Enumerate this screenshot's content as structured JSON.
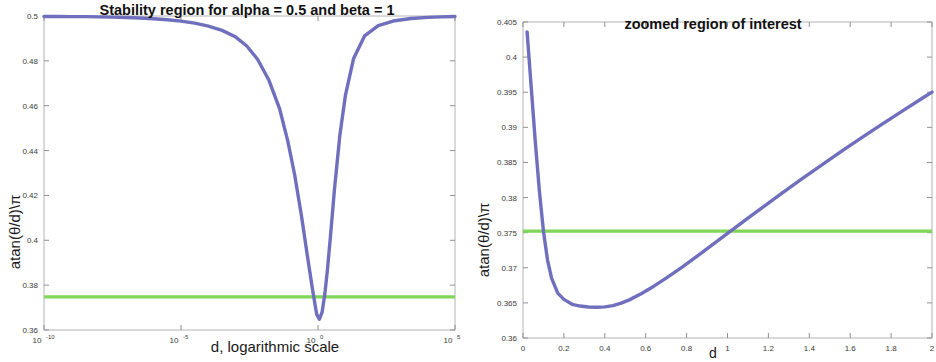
{
  "figure": {
    "width": 936,
    "height": 362,
    "background": "#ffffff",
    "panels": 2
  },
  "colors": {
    "curve_blue": "#6F6FBE",
    "threshold_green": "#7FD659",
    "axis_gray": "#b4b4b4",
    "tick_text": "#3a3a3a",
    "title_text": "#111111"
  },
  "chart_data": [
    {
      "id": "left",
      "type": "line",
      "title": "Stability region for alpha = 0.5 and beta = 1",
      "xlabel": "d, logarithmic scale",
      "ylabel": "atan(θ/d)\\π",
      "xscale": "log",
      "grid": false,
      "legend": "none",
      "xlim": [
        1e-10,
        100000.0
      ],
      "ylim": [
        0.36,
        0.5
      ],
      "xticks": [
        1e-10,
        1e-05,
        1,
        100000
      ],
      "xticklabels": [
        "10^-10",
        "10^-5",
        "10^0",
        "10^5"
      ],
      "xtick_mantissa": [
        "10",
        "10",
        "10",
        "10"
      ],
      "xtick_exponent": [
        "-10",
        "-5",
        "0",
        "5"
      ],
      "yticks": [
        0.36,
        0.38,
        0.4,
        0.42,
        0.44,
        0.46,
        0.48,
        0.5
      ],
      "yticklabels": [
        "0.36",
        "0.38",
        "0.4",
        "0.42",
        "0.44",
        "0.46",
        "0.48",
        "0.5"
      ],
      "series": [
        {
          "name": "atan(theta/d)/pi",
          "color": "#6F6FBE",
          "x_log10": [
            -10.0,
            -9.5,
            -9.0,
            -8.5,
            -8.0,
            -7.5,
            -7.0,
            -6.5,
            -6.0,
            -5.5,
            -5.0,
            -4.5,
            -4.0,
            -3.5,
            -3.0,
            -2.6,
            -2.2,
            -1.8,
            -1.4,
            -1.1,
            -0.85,
            -0.6,
            -0.4,
            -0.2,
            -0.05,
            0.05,
            0.15,
            0.25,
            0.35,
            0.45,
            0.6,
            0.8,
            1.0,
            1.3,
            1.7,
            2.2,
            2.8,
            3.4,
            4.0,
            4.5,
            5.0
          ],
          "y": [
            0.4998,
            0.4998,
            0.4997,
            0.4997,
            0.4996,
            0.4995,
            0.4993,
            0.4991,
            0.4988,
            0.4983,
            0.4977,
            0.4968,
            0.4955,
            0.4936,
            0.4906,
            0.4866,
            0.4806,
            0.4716,
            0.4586,
            0.4441,
            0.4291,
            0.4106,
            0.3941,
            0.3781,
            0.3671,
            0.3648,
            0.368,
            0.376,
            0.3876,
            0.4011,
            0.4226,
            0.4471,
            0.4646,
            0.4811,
            0.4911,
            0.4957,
            0.4979,
            0.4989,
            0.4994,
            0.4996,
            0.4998
          ]
        },
        {
          "name": "threshold",
          "color": "#7FD659",
          "constant_y": 0.3748
        }
      ],
      "annotations": {
        "minimum_value": 0.3648,
        "crossings": [
          0.3748,
          0.3748
        ]
      }
    },
    {
      "id": "right",
      "type": "line",
      "title": "zoomed region of interest",
      "xlabel": "d",
      "ylabel": "atan(θ/d)\\π",
      "xscale": "linear",
      "grid": false,
      "legend": "none",
      "xlim": [
        0,
        2
      ],
      "ylim": [
        0.36,
        0.405
      ],
      "xticks": [
        0,
        0.2,
        0.4,
        0.6,
        0.8,
        1,
        1.2,
        1.4,
        1.6,
        1.8,
        2
      ],
      "xticklabels": [
        "0",
        "0.2",
        "0.4",
        "0.6",
        "0.8",
        "1",
        "1.2",
        "1.4",
        "1.6",
        "1.8",
        "2"
      ],
      "yticks": [
        0.36,
        0.365,
        0.37,
        0.375,
        0.38,
        0.385,
        0.39,
        0.395,
        0.4,
        0.405
      ],
      "yticklabels": [
        "0.36",
        "0.365",
        "0.37",
        "0.375",
        "0.38",
        "0.385",
        "0.39",
        "0.395",
        "0.4",
        "0.405"
      ],
      "series": [
        {
          "name": "atan(theta/d)/pi",
          "color": "#6F6FBE",
          "x": [
            0.02,
            0.04,
            0.06,
            0.08,
            0.1,
            0.12,
            0.14,
            0.17,
            0.2,
            0.24,
            0.28,
            0.32,
            0.36,
            0.4,
            0.44,
            0.48,
            0.52,
            0.58,
            0.64,
            0.7,
            0.78,
            0.86,
            0.94,
            1.02,
            1.1,
            1.18,
            1.26,
            1.36,
            1.46,
            1.56,
            1.66,
            1.76,
            1.86,
            1.96,
            2.0
          ],
          "y": [
            0.4036,
            0.3958,
            0.388,
            0.381,
            0.3752,
            0.3711,
            0.3685,
            0.3664,
            0.3655,
            0.3648,
            0.36455,
            0.36442,
            0.36438,
            0.36443,
            0.36462,
            0.36496,
            0.36543,
            0.36633,
            0.36738,
            0.36852,
            0.37014,
            0.37184,
            0.37358,
            0.37533,
            0.37707,
            0.37879,
            0.38049,
            0.38258,
            0.38463,
            0.38664,
            0.3886,
            0.39053,
            0.39242,
            0.39428,
            0.39502
          ]
        },
        {
          "name": "threshold",
          "color": "#7FD659",
          "constant_y": 0.37521
        }
      ],
      "annotations": {
        "minimum_value": 0.36438,
        "crossings": [
          0.1,
          1.22
        ]
      }
    }
  ]
}
